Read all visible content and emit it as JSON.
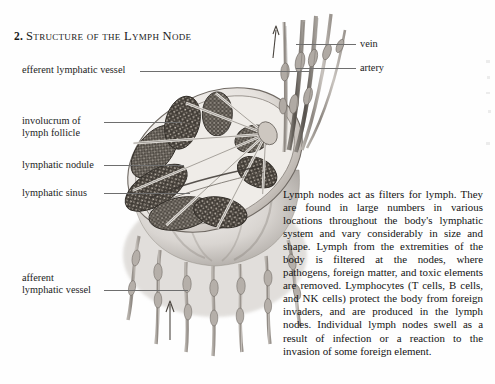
{
  "page": {
    "heading_number": "2.",
    "heading_title": "Structure of the Lymph Node",
    "background_color": "#fefefe",
    "ink_color": "#1a1a1a",
    "leader_line_color": "#6e6e6e"
  },
  "labels": {
    "efferent": "efferent lymphatic vessel",
    "involucrum_line1": "involucrum of",
    "involucrum_line2": "lymph follicle",
    "nodule": "lymphatic nodule",
    "sinus": "lymphatic sinus",
    "afferent_line1": "afferent",
    "afferent_line2": "lymphatic vessel",
    "vein": "vein",
    "artery": "artery"
  },
  "body": {
    "paragraph": "Lymph nodes act as filters for lymph. They are found in large numbers in various locations throughout the body's lymphatic system and vary considerably in size and shape. Lymph from the extremities of the body is filtered at the nodes, where pathogens, foreign matter, and toxic elements are removed. Lymphocytes (T cells, B cells, and NK cells) protect the body from foreign invaders, and are produced in the lymph nodes. Individual lymph nodes swell as a result of infection or a reaction to the invasion of some foreign element."
  },
  "illustration": {
    "caption": "cross-sectional anatomical drawing of a lymph node",
    "parts": [
      "lymph node capsule",
      "cortical lobules",
      "medullary sinuses",
      "hilum",
      "efferent lymphatic vessel bundle",
      "afferent lymphatic vessels",
      "vein",
      "artery",
      "flow direction arrows"
    ],
    "flow_arrow_count": 2
  }
}
